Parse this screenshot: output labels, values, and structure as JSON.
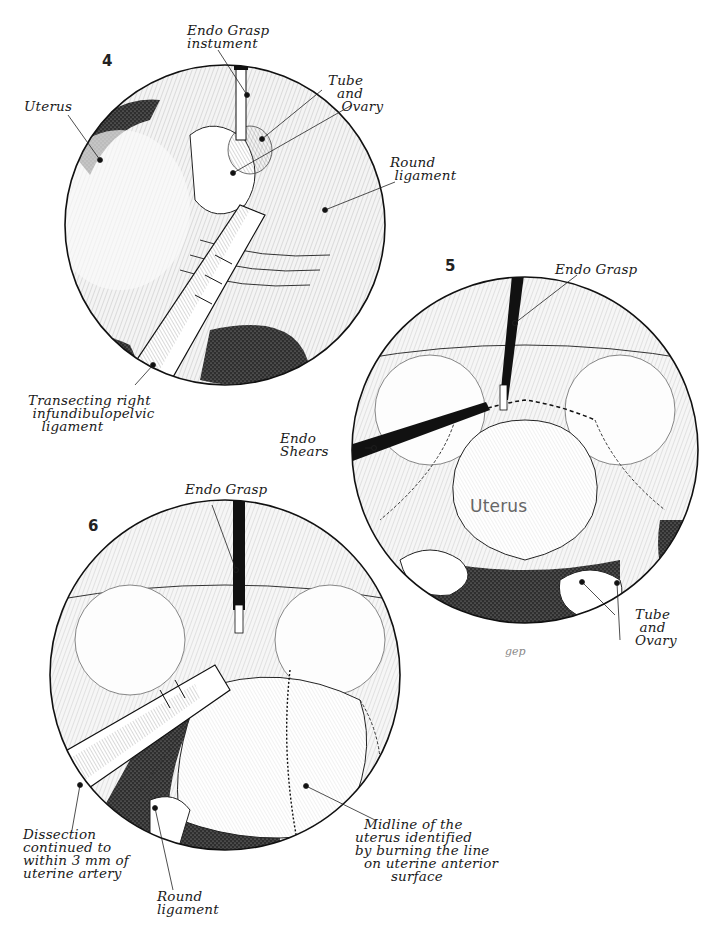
{
  "figure": {
    "signature": "gep",
    "colors": {
      "ink": "#111111",
      "background": "#ffffff",
      "stipple": "#3a3a3a",
      "tissue": "#e9e9e9"
    }
  },
  "panels": [
    {
      "number": "4",
      "labels": {
        "instrument": "Endo Grasp\ninstument",
        "uterus": "Uterus",
        "tube_ovary": "Tube\n  and\n   Ovary",
        "round_ligament": "Round\n ligament",
        "transecting": "Transecting right\n infundibulopelvic\n   ligament"
      }
    },
    {
      "number": "5",
      "labels": {
        "instrument": "Endo Grasp",
        "shears": "Endo\nShears",
        "uterus_inner": "Uterus",
        "tube_ovary": "Tube\n and\nOvary"
      }
    },
    {
      "number": "6",
      "labels": {
        "instrument": "Endo Grasp",
        "dissection": "Dissection\ncontinued to\nwithin 3 mm of\nuterine artery",
        "round_ligament": "Round\nligament",
        "midline": "  Midline of the\nuterus identified\nby burning the line\n  on uterine anterior\n        surface"
      }
    }
  ]
}
